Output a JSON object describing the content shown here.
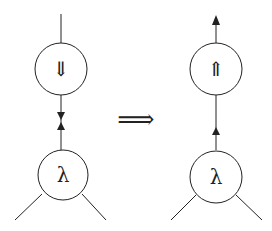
{
  "diagram": {
    "left": {
      "top_node": {
        "label": "⇓",
        "meaning": "double-down-arrow"
      },
      "bottom_node": {
        "label": "λ"
      },
      "connector": "opposing arrows (down and up) meeting between nodes"
    },
    "transform_arrow": {
      "label": "⟹"
    },
    "right": {
      "top_node": {
        "label": "⇑",
        "meaning": "double-up-arrow"
      },
      "bottom_node": {
        "label": "λ"
      },
      "connector": "upward arrows"
    },
    "colors": {
      "stroke": "#222222",
      "background": "#ffffff"
    }
  }
}
